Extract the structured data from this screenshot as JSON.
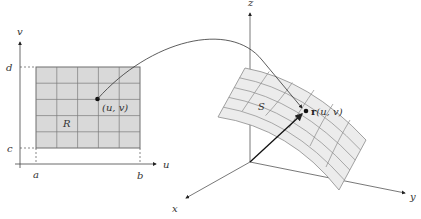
{
  "domain_region": {
    "name": "R",
    "axes": {
      "horizontal": "u",
      "vertical": "v"
    },
    "ticks": {
      "u_min": "a",
      "u_max": "b",
      "v_min": "c",
      "v_max": "d"
    },
    "grid": {
      "cols": 5,
      "rows": 5
    },
    "point_label": "(u, v)",
    "fill_color": "#d9d9d9",
    "grid_color": "#7a7a7a"
  },
  "surface": {
    "name": "S",
    "axes": {
      "x": "x",
      "y": "y",
      "z": "z"
    },
    "point_label_bold": "r",
    "point_label_args": "(u, v)",
    "fill_color": "#ececec",
    "grid_color": "#8a8a8a"
  },
  "mapping_arrow": {
    "from": "(u, v)",
    "to": "r(u, v)"
  }
}
